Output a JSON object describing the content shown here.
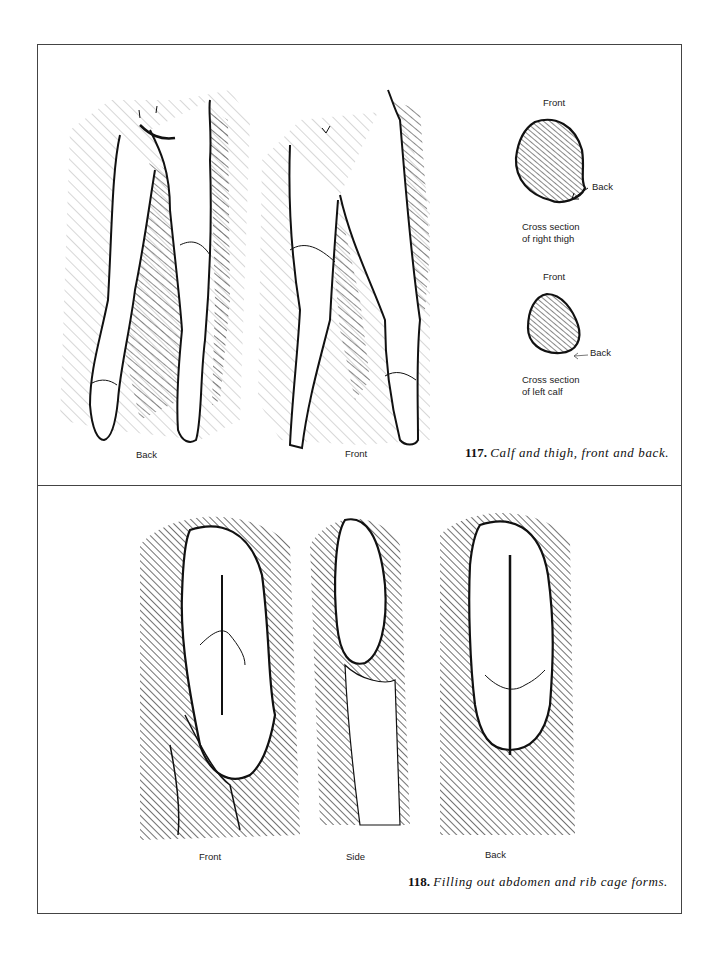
{
  "figures": [
    {
      "number": "117.",
      "caption": "Calf and thigh, front and back.",
      "view_labels": [
        "Back",
        "Front"
      ],
      "cross_sections": [
        {
          "front_label": "Front",
          "back_label": "Back",
          "caption_line1": "Cross section",
          "caption_line2": "of right thigh"
        },
        {
          "front_label": "Front",
          "back_label": "Back",
          "caption_line1": "Cross section",
          "caption_line2": "of left calf"
        }
      ]
    },
    {
      "number": "118.",
      "caption": "Filling out abdomen and rib cage forms.",
      "view_labels": [
        "Front",
        "Side",
        "Back"
      ]
    }
  ],
  "colors": {
    "ink": "#111111",
    "frame": "#444444",
    "paper": "#ffffff"
  }
}
